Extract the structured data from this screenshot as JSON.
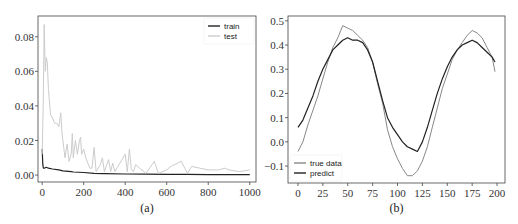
{
  "chart_data": [
    {
      "id": "a",
      "type": "line",
      "caption": "(a)",
      "title": "",
      "xlabel": "",
      "ylabel": "",
      "xlim": [
        -20,
        1030
      ],
      "ylim": [
        -0.004,
        0.092
      ],
      "x_ticks": [
        0,
        200,
        400,
        600,
        800,
        1000
      ],
      "x_tick_labels": [
        "0",
        "200",
        "400",
        "600",
        "800",
        "1000"
      ],
      "y_ticks": [
        0.0,
        0.02,
        0.04,
        0.06,
        0.08
      ],
      "y_tick_labels": [
        "0.00",
        "0.02",
        "0.04",
        "0.06",
        "0.08"
      ],
      "grid": false,
      "legend_position": "upper right",
      "series": [
        {
          "name": "train",
          "color": "#222222",
          "x": [
            0,
            3,
            6,
            10,
            20,
            30,
            50,
            80,
            100,
            140,
            150,
            200,
            250,
            300,
            400,
            500,
            600,
            700,
            800,
            900,
            1000
          ],
          "values": [
            0.015,
            0.006,
            0.004,
            0.004,
            0.0045,
            0.004,
            0.0035,
            0.003,
            0.0025,
            0.002,
            0.0018,
            0.0015,
            0.001,
            0.0008,
            0.0006,
            0.0005,
            0.0004,
            0.0004,
            0.0003,
            0.0003,
            0.0003
          ]
        },
        {
          "name": "test",
          "color": "#cccccc",
          "x": [
            0,
            5,
            10,
            15,
            20,
            25,
            30,
            40,
            50,
            60,
            70,
            80,
            90,
            95,
            100,
            110,
            120,
            130,
            140,
            145,
            150,
            160,
            170,
            180,
            185,
            190,
            200,
            210,
            220,
            230,
            240,
            250,
            260,
            280,
            290,
            300,
            320,
            330,
            340,
            350,
            400,
            410,
            420,
            430,
            440,
            450,
            500,
            540,
            560,
            600,
            620,
            670,
            700,
            720,
            760,
            800,
            850,
            880,
            900,
            950,
            1000
          ],
          "values": [
            0.012,
            0.04,
            0.087,
            0.06,
            0.068,
            0.065,
            0.05,
            0.035,
            0.033,
            0.03,
            0.03,
            0.028,
            0.036,
            0.025,
            0.02,
            0.01,
            0.018,
            0.008,
            0.012,
            0.024,
            0.01,
            0.02,
            0.012,
            0.02,
            0.022,
            0.012,
            0.015,
            0.01,
            0.007,
            0.004,
            0.004,
            0.016,
            0.002,
            0.006,
            0.01,
            0.002,
            0.009,
            0.002,
            0.007,
            0.002,
            0.012,
            0.002,
            0.015,
            0.003,
            0.002,
            0.006,
            0.001,
            0.008,
            0.001,
            0.003,
            0.005,
            0.008,
            0.001,
            0.005,
            0.004,
            0.003,
            0.003,
            0.004,
            0.003,
            0.002,
            0.003
          ]
        }
      ]
    },
    {
      "id": "b",
      "type": "line",
      "caption": "(b)",
      "title": "",
      "xlabel": "",
      "ylabel": "",
      "xlim": [
        -10,
        208
      ],
      "ylim": [
        -0.17,
        0.52
      ],
      "x_ticks": [
        0,
        25,
        50,
        75,
        100,
        125,
        150,
        175,
        200
      ],
      "x_tick_labels": [
        "0",
        "25",
        "50",
        "75",
        "100",
        "125",
        "150",
        "175",
        "200"
      ],
      "y_ticks": [
        -0.1,
        0.0,
        0.1,
        0.2,
        0.3,
        0.4,
        0.5
      ],
      "y_tick_labels": [
        "−0.1",
        "0.0",
        "0.1",
        "0.2",
        "0.3",
        "0.4",
        "0.5"
      ],
      "grid": false,
      "legend_position": "lower left",
      "series": [
        {
          "name": "true data",
          "color": "#888888",
          "x": [
            0,
            5,
            10,
            15,
            20,
            25,
            30,
            35,
            40,
            45,
            50,
            55,
            60,
            65,
            70,
            75,
            80,
            85,
            90,
            95,
            100,
            105,
            110,
            115,
            120,
            125,
            130,
            135,
            140,
            145,
            150,
            155,
            160,
            165,
            170,
            175,
            180,
            185,
            190,
            195,
            198
          ],
          "values": [
            -0.04,
            0.0,
            0.07,
            0.13,
            0.19,
            0.26,
            0.33,
            0.39,
            0.43,
            0.48,
            0.47,
            0.46,
            0.44,
            0.42,
            0.39,
            0.33,
            0.24,
            0.16,
            0.05,
            -0.02,
            -0.07,
            -0.11,
            -0.14,
            -0.14,
            -0.12,
            -0.08,
            -0.02,
            0.06,
            0.14,
            0.22,
            0.28,
            0.34,
            0.38,
            0.41,
            0.44,
            0.46,
            0.45,
            0.43,
            0.39,
            0.35,
            0.29
          ]
        },
        {
          "name": "predict",
          "color": "#222222",
          "x": [
            0,
            5,
            10,
            15,
            20,
            25,
            30,
            35,
            40,
            45,
            50,
            55,
            60,
            65,
            70,
            75,
            80,
            85,
            90,
            95,
            100,
            105,
            110,
            115,
            120,
            125,
            130,
            135,
            140,
            145,
            150,
            155,
            160,
            165,
            170,
            175,
            180,
            185,
            190,
            195,
            198
          ],
          "values": [
            0.06,
            0.09,
            0.14,
            0.19,
            0.25,
            0.3,
            0.34,
            0.38,
            0.4,
            0.42,
            0.43,
            0.42,
            0.42,
            0.41,
            0.38,
            0.33,
            0.25,
            0.17,
            0.1,
            0.06,
            0.03,
            0.0,
            -0.02,
            -0.03,
            -0.04,
            0.0,
            0.06,
            0.13,
            0.2,
            0.26,
            0.31,
            0.35,
            0.38,
            0.4,
            0.41,
            0.42,
            0.41,
            0.39,
            0.37,
            0.35,
            0.33
          ]
        }
      ]
    }
  ]
}
